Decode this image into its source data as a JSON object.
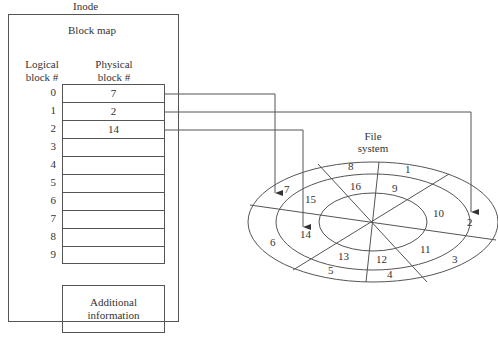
{
  "inode": {
    "title": "Inode",
    "block_map_title": "Block map",
    "logical_header": [
      "Logical",
      "block #"
    ],
    "physical_header": [
      "Physical",
      "block #"
    ],
    "rows": [
      {
        "logical": "0",
        "physical": "7"
      },
      {
        "logical": "1",
        "physical": "2"
      },
      {
        "logical": "2",
        "physical": "14"
      },
      {
        "logical": "3",
        "physical": ""
      },
      {
        "logical": "4",
        "physical": ""
      },
      {
        "logical": "5",
        "physical": ""
      },
      {
        "logical": "6",
        "physical": ""
      },
      {
        "logical": "7",
        "physical": ""
      },
      {
        "logical": "8",
        "physical": ""
      },
      {
        "logical": "9",
        "physical": ""
      }
    ],
    "additional": [
      "Additional",
      "information"
    ]
  },
  "file_system": {
    "title": [
      "File",
      "system"
    ],
    "outer_blocks": [
      "1",
      "2",
      "3",
      "4",
      "5",
      "6",
      "7",
      "8"
    ],
    "middle_blocks": [
      "9",
      "10",
      "11",
      "12",
      "13",
      "14",
      "15",
      "16"
    ]
  },
  "mappings": [
    {
      "logical": "0",
      "physical": "7"
    },
    {
      "logical": "1",
      "physical": "2"
    },
    {
      "logical": "2",
      "physical": "14"
    }
  ]
}
